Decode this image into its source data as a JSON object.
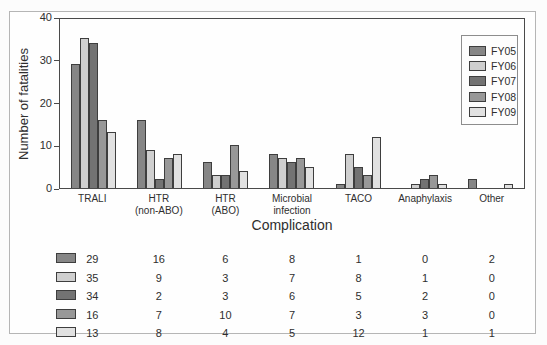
{
  "chart_data": {
    "type": "bar",
    "title": "",
    "xlabel": "Complication",
    "ylabel": "Number of fatalities",
    "ylim": [
      0,
      40
    ],
    "yticks": [
      0,
      10,
      20,
      30,
      40
    ],
    "grid": false,
    "legend_position": "upper-right",
    "bar_border_color": "#3e3e3e",
    "categories": [
      "TRALI",
      "HTR (non-ABO)",
      "HTR (ABO)",
      "Microbial infection",
      "TACO",
      "Anaphylaxis",
      "Other"
    ],
    "category_label_lines": [
      [
        "TRALI"
      ],
      [
        "HTR",
        "(non-ABO)"
      ],
      [
        "HTR",
        "(ABO)"
      ],
      [
        "Microbial",
        "infection"
      ],
      [
        "TACO"
      ],
      [
        "Anaphylaxis"
      ],
      [
        "Other"
      ]
    ],
    "series": [
      {
        "name": "FY05",
        "color": "#868686",
        "values": [
          29,
          16,
          6,
          8,
          1,
          0,
          2
        ]
      },
      {
        "name": "FY06",
        "color": "#cfcfcf",
        "values": [
          35,
          9,
          3,
          7,
          8,
          1,
          0
        ]
      },
      {
        "name": "FY07",
        "color": "#737373",
        "values": [
          34,
          2,
          3,
          6,
          5,
          2,
          0
        ]
      },
      {
        "name": "FY08",
        "color": "#989898",
        "values": [
          16,
          7,
          10,
          7,
          3,
          3,
          0
        ]
      },
      {
        "name": "FY09",
        "color": "#e1e1e1",
        "values": [
          13,
          8,
          4,
          5,
          12,
          1,
          1
        ]
      }
    ]
  }
}
